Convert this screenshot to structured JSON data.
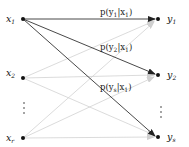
{
  "diagram": {
    "type": "channel-transition-graph",
    "inputs": [
      {
        "id": "x1",
        "base": "x",
        "sub": "1",
        "cx": 23,
        "cy": 19
      },
      {
        "id": "x2",
        "base": "x",
        "sub": "2",
        "cx": 23,
        "cy": 78
      },
      {
        "id": "xr",
        "base": "x",
        "sub": "r",
        "cx": 23,
        "cy": 138
      }
    ],
    "outputs": [
      {
        "id": "y1",
        "base": "y",
        "sub": "1",
        "cx": 158,
        "cy": 19
      },
      {
        "id": "y2",
        "base": "y",
        "sub": "2",
        "cx": 158,
        "cy": 75
      },
      {
        "id": "ys",
        "base": "y",
        "sub": "s",
        "cx": 158,
        "cy": 137
      }
    ],
    "input_ellipsis": "⋮",
    "output_ellipsis": "⋮",
    "highlighted_edges": [
      {
        "from": "x1",
        "to": "y1",
        "label": "p(y1|x1)",
        "label_parts": [
          "p(y",
          "1",
          "|x",
          "1",
          ")"
        ]
      },
      {
        "from": "x1",
        "to": "y2",
        "label": "p(y2|x1)",
        "label_parts": [
          "p(y",
          "2",
          "|x",
          "1",
          ")"
        ]
      },
      {
        "from": "x1",
        "to": "ys",
        "label": "p(ys|x1)",
        "label_parts": [
          "p(y",
          "s",
          "|x",
          "1",
          ")"
        ]
      }
    ],
    "faded_edges": [
      {
        "from": "x2",
        "to": "y1"
      },
      {
        "from": "x2",
        "to": "y2"
      },
      {
        "from": "x2",
        "to": "ys"
      },
      {
        "from": "xr",
        "to": "y1"
      },
      {
        "from": "xr",
        "to": "y2"
      },
      {
        "from": "xr",
        "to": "ys"
      }
    ],
    "colors": {
      "highlight_edge": "#333333",
      "faded_edge": "#cfcfcf",
      "node": "#111111"
    }
  }
}
